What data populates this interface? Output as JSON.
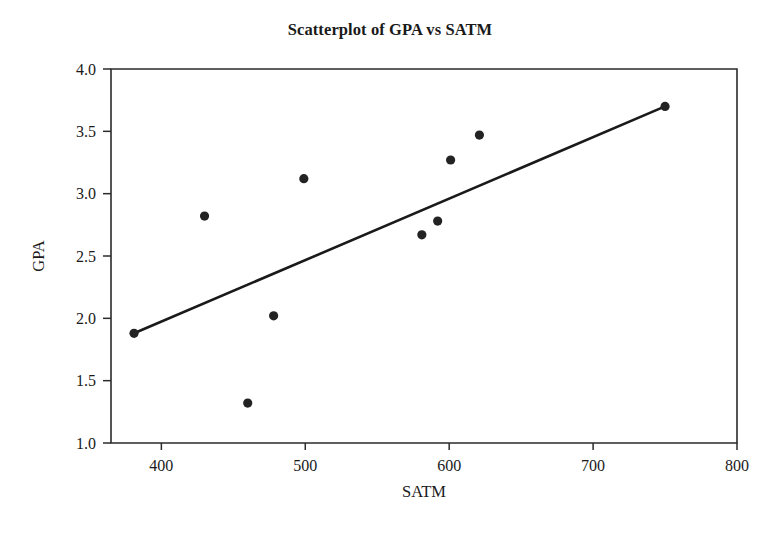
{
  "chart_data": {
    "type": "scatter",
    "title": "Scatterplot of GPA vs SATM",
    "xlabel": "SATM",
    "ylabel": "GPA",
    "xlim": [
      365,
      800
    ],
    "ylim": [
      1.0,
      4.0
    ],
    "grid": false,
    "legend": "none",
    "x_ticks": [
      400,
      500,
      600,
      700,
      800
    ],
    "x_tick_labels": [
      "400",
      "500",
      "600",
      "700",
      "800"
    ],
    "y_ticks": [
      1.0,
      1.5,
      2.0,
      2.5,
      3.0,
      3.5,
      4.0
    ],
    "y_tick_labels": [
      "1.0",
      "1.5",
      "2.0",
      "2.5",
      "3.0",
      "3.5",
      "4.0"
    ],
    "series": [
      {
        "name": "GPA vs SATM",
        "marker": "filled-circle",
        "color": "#232323",
        "x": [
          381,
          430,
          460,
          478,
          499,
          581,
          592,
          601,
          621,
          750
        ],
        "y": [
          1.88,
          2.82,
          1.32,
          2.02,
          3.12,
          2.67,
          2.78,
          3.27,
          3.47,
          3.7
        ],
        "points": [
          {
            "x": 381,
            "y": 1.88
          },
          {
            "x": 430,
            "y": 2.82
          },
          {
            "x": 460,
            "y": 1.32
          },
          {
            "x": 478,
            "y": 2.02
          },
          {
            "x": 499,
            "y": 3.12
          },
          {
            "x": 581,
            "y": 2.67
          },
          {
            "x": 592,
            "y": 2.78
          },
          {
            "x": 601,
            "y": 3.27
          },
          {
            "x": 621,
            "y": 3.47
          },
          {
            "x": 750,
            "y": 3.7
          }
        ]
      }
    ],
    "fit_line": {
      "name": "regression-line",
      "color": "#1a1a1a",
      "x_start": 381,
      "y_start": 1.88,
      "x_end": 750,
      "y_end": 3.7
    }
  },
  "figure": {
    "background_color": "#ffffff",
    "axis_color": "#2b2b2b",
    "marker_color": "#232323",
    "line_color": "#1a1a1a"
  }
}
